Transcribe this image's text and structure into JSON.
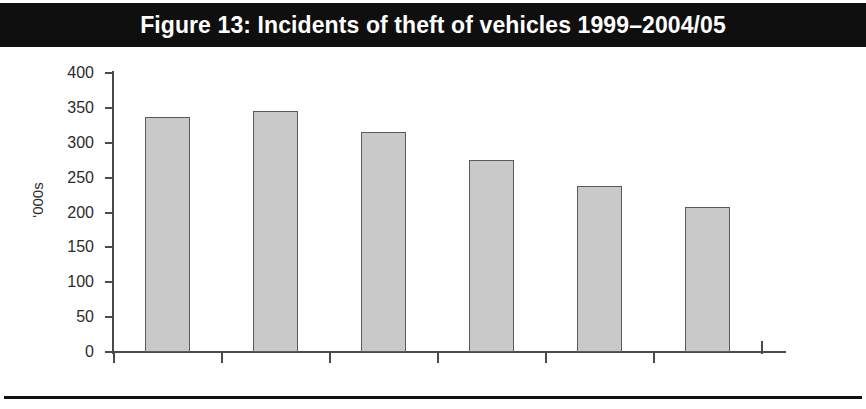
{
  "figure": {
    "title": "Figure 13: Incidents of theft of vehicles 1999–2004/05",
    "title_bar_color": "#100f0f",
    "title_text_color": "#ffffff",
    "background_color": "#ffffff"
  },
  "chart_data": {
    "type": "bar",
    "title": "Figure 13: Incidents of theft of vehicles 1999–2004/05",
    "categories": [
      "1999",
      "2000",
      "2001–2002",
      "2002–2003",
      "2003–2004",
      "2004–2005"
    ],
    "values": [
      337,
      345,
      315,
      276,
      238,
      208
    ],
    "series": [
      {
        "name": "Incidents of theft of vehicles",
        "values": [
          337,
          345,
          315,
          276,
          238,
          208
        ]
      }
    ],
    "xlabel": "",
    "ylabel": "'000s",
    "ylim": [
      0,
      400
    ],
    "ytick_values": [
      0,
      50,
      100,
      150,
      200,
      250,
      300,
      350,
      400
    ],
    "ytick_labels": [
      "0",
      "50",
      "100",
      "150",
      "200",
      "250",
      "300",
      "350",
      "400"
    ],
    "grid": false,
    "legend": false,
    "bar_fill_color": "#c9c9c9",
    "bar_edge_color": "#5a5a5a",
    "axis_color": "#4a4a4a"
  }
}
